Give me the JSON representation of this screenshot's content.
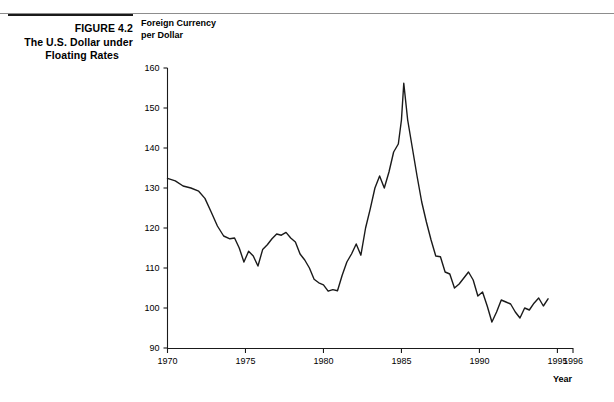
{
  "figure": {
    "number_line": "FIGURE 4.2",
    "title_line_1": "The U.S. Dollar under",
    "title_line_2": "Floating Rates"
  },
  "chart_data": {
    "type": "line",
    "title": "",
    "ylabel_line_1": "Foreign Currency",
    "ylabel_line_2": "per Dollar",
    "xlabel": "Year",
    "ylim": [
      90,
      160
    ],
    "xlim": [
      1970,
      1996
    ],
    "yticks": [
      90,
      100,
      110,
      120,
      130,
      140,
      150,
      160
    ],
    "ytick_labels": [
      "90",
      "100",
      "110",
      "120",
      "130",
      "140",
      "150",
      "160"
    ],
    "xticks": [
      1970,
      1975,
      1980,
      1985,
      1990,
      1995,
      1996
    ],
    "xtick_labels": [
      "1970",
      "1975",
      "1980",
      "1985",
      "1990",
      "1995",
      "1996"
    ],
    "grid": false,
    "legend": "none",
    "series": [
      {
        "name": "Trade-weighted U.S. dollar index",
        "color": "#1a1a1a",
        "x": [
          1970.0,
          1970.5,
          1971.0,
          1971.5,
          1972.0,
          1972.4,
          1972.8,
          1973.2,
          1973.6,
          1974.0,
          1974.3,
          1974.6,
          1974.9,
          1975.2,
          1975.5,
          1975.8,
          1976.1,
          1976.4,
          1976.7,
          1977.0,
          1977.3,
          1977.6,
          1977.9,
          1978.2,
          1978.5,
          1978.8,
          1979.1,
          1979.4,
          1979.7,
          1980.0,
          1980.3,
          1980.6,
          1980.9,
          1981.2,
          1981.5,
          1981.8,
          1982.1,
          1982.4,
          1982.7,
          1983.0,
          1983.3,
          1983.6,
          1983.9,
          1984.2,
          1984.5,
          1984.8,
          1985.0,
          1985.15,
          1985.4,
          1985.7,
          1986.0,
          1986.3,
          1986.6,
          1986.9,
          1987.2,
          1987.5,
          1987.8,
          1988.1,
          1988.4,
          1988.7,
          1989.0,
          1989.3,
          1989.6,
          1989.9,
          1990.2,
          1990.5,
          1990.8,
          1991.1,
          1991.4,
          1991.7,
          1992.0,
          1992.3,
          1992.6,
          1992.9,
          1993.2,
          1993.5,
          1993.8,
          1994.1,
          1994.4
        ],
        "y": [
          132.4,
          131.8,
          130.5,
          130.0,
          129.2,
          127.4,
          124.0,
          120.5,
          118.0,
          117.3,
          117.5,
          115.0,
          111.5,
          114.2,
          113.0,
          110.5,
          114.6,
          115.8,
          117.3,
          118.5,
          118.2,
          118.9,
          117.5,
          116.5,
          113.5,
          112.0,
          110.0,
          107.2,
          106.3,
          105.8,
          104.2,
          104.6,
          104.3,
          108.2,
          111.5,
          113.5,
          116.0,
          113.2,
          120.0,
          124.8,
          130.0,
          133.0,
          130.0,
          134.0,
          139.0,
          141.0,
          147.0,
          156.2,
          147.0,
          140.0,
          133.0,
          126.5,
          121.5,
          117.0,
          113.0,
          112.8,
          109.0,
          108.5,
          105.0,
          106.0,
          107.5,
          109.0,
          107.0,
          103.0,
          104.0,
          100.5,
          96.5,
          99.0,
          102.0,
          101.5,
          101.0,
          99.0,
          97.5,
          100.0,
          99.5,
          101.2,
          102.5,
          100.5,
          102.3
        ]
      }
    ]
  }
}
